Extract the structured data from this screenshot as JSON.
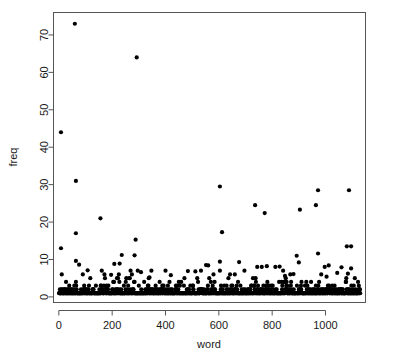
{
  "chart_data": {
    "type": "scatter",
    "title": "",
    "xlabel": "word",
    "ylabel": "freq",
    "xlim": [
      -20,
      1150
    ],
    "ylim": [
      -1.5,
      76
    ],
    "xticks": [
      0,
      200,
      400,
      600,
      800,
      1000
    ],
    "yticks": [
      0,
      10,
      20,
      30,
      40,
      50,
      60,
      70
    ],
    "grid": false,
    "legend": null,
    "point_color": "#000000",
    "point_radius": 2.1,
    "frame_color": "#555555",
    "background": "#ffffff",
    "outliers": [
      {
        "x": 60,
        "y": 73
      },
      {
        "x": 292,
        "y": 64
      },
      {
        "x": 8,
        "y": 44
      },
      {
        "x": 64,
        "y": 31
      },
      {
        "x": 604,
        "y": 29.5
      },
      {
        "x": 972,
        "y": 28.5
      },
      {
        "x": 1088,
        "y": 28.5
      },
      {
        "x": 964,
        "y": 24.5
      },
      {
        "x": 736,
        "y": 24.5
      },
      {
        "x": 904,
        "y": 23.3
      },
      {
        "x": 772,
        "y": 22.4
      },
      {
        "x": 156,
        "y": 21
      },
      {
        "x": 612,
        "y": 17.3
      },
      {
        "x": 64,
        "y": 17
      },
      {
        "x": 288,
        "y": 15.3
      },
      {
        "x": 1080,
        "y": 13.5
      },
      {
        "x": 1096,
        "y": 13.5
      },
      {
        "x": 8,
        "y": 13
      },
      {
        "x": 972,
        "y": 11.6
      },
      {
        "x": 236,
        "y": 11.2
      },
      {
        "x": 284,
        "y": 11.1
      },
      {
        "x": 64,
        "y": 9.6
      },
      {
        "x": 604,
        "y": 9.4
      },
      {
        "x": 676,
        "y": 9.3
      },
      {
        "x": 900,
        "y": 9.2
      },
      {
        "x": 228,
        "y": 8.9
      },
      {
        "x": 208,
        "y": 8.8
      },
      {
        "x": 76,
        "y": 8.6
      },
      {
        "x": 552,
        "y": 8.5
      },
      {
        "x": 560,
        "y": 8.4
      },
      {
        "x": 1012,
        "y": 8.4
      },
      {
        "x": 780,
        "y": 8.2
      },
      {
        "x": 828,
        "y": 8.1
      },
      {
        "x": 744,
        "y": 8.0
      },
      {
        "x": 1060,
        "y": 7.9
      },
      {
        "x": 1096,
        "y": 7.6
      },
      {
        "x": 108,
        "y": 7.1
      },
      {
        "x": 296,
        "y": 7.0
      },
      {
        "x": 484,
        "y": 6.9
      },
      {
        "x": 512,
        "y": 6.8
      },
      {
        "x": 308,
        "y": 6.6
      },
      {
        "x": 1044,
        "y": 6.4
      },
      {
        "x": 1084,
        "y": 6.2
      },
      {
        "x": 880,
        "y": 6.1
      },
      {
        "x": 660,
        "y": 6.0
      },
      {
        "x": 196,
        "y": 5.9
      },
      {
        "x": 420,
        "y": 5.8
      },
      {
        "x": 848,
        "y": 5.6
      },
      {
        "x": 1004,
        "y": 5.4
      },
      {
        "x": 340,
        "y": 5.2
      },
      {
        "x": 636,
        "y": 5.0
      }
    ],
    "series": [
      {
        "name": "word frequency",
        "n_points": 1130,
        "x_range": [
          1,
          1130
        ],
        "y_range": [
          1,
          73
        ],
        "dense_band_y_range": [
          1,
          3
        ],
        "description": "One point per word index, frequency on vertical axis."
      }
    ]
  },
  "axes": {
    "y_axis_label": "freq",
    "x_axis_label": "word",
    "y_tick_labels": [
      "0",
      "10",
      "20",
      "30",
      "40",
      "50",
      "60",
      "70"
    ],
    "x_tick_labels": [
      "0",
      "200",
      "400",
      "600",
      "800",
      "1000"
    ]
  }
}
